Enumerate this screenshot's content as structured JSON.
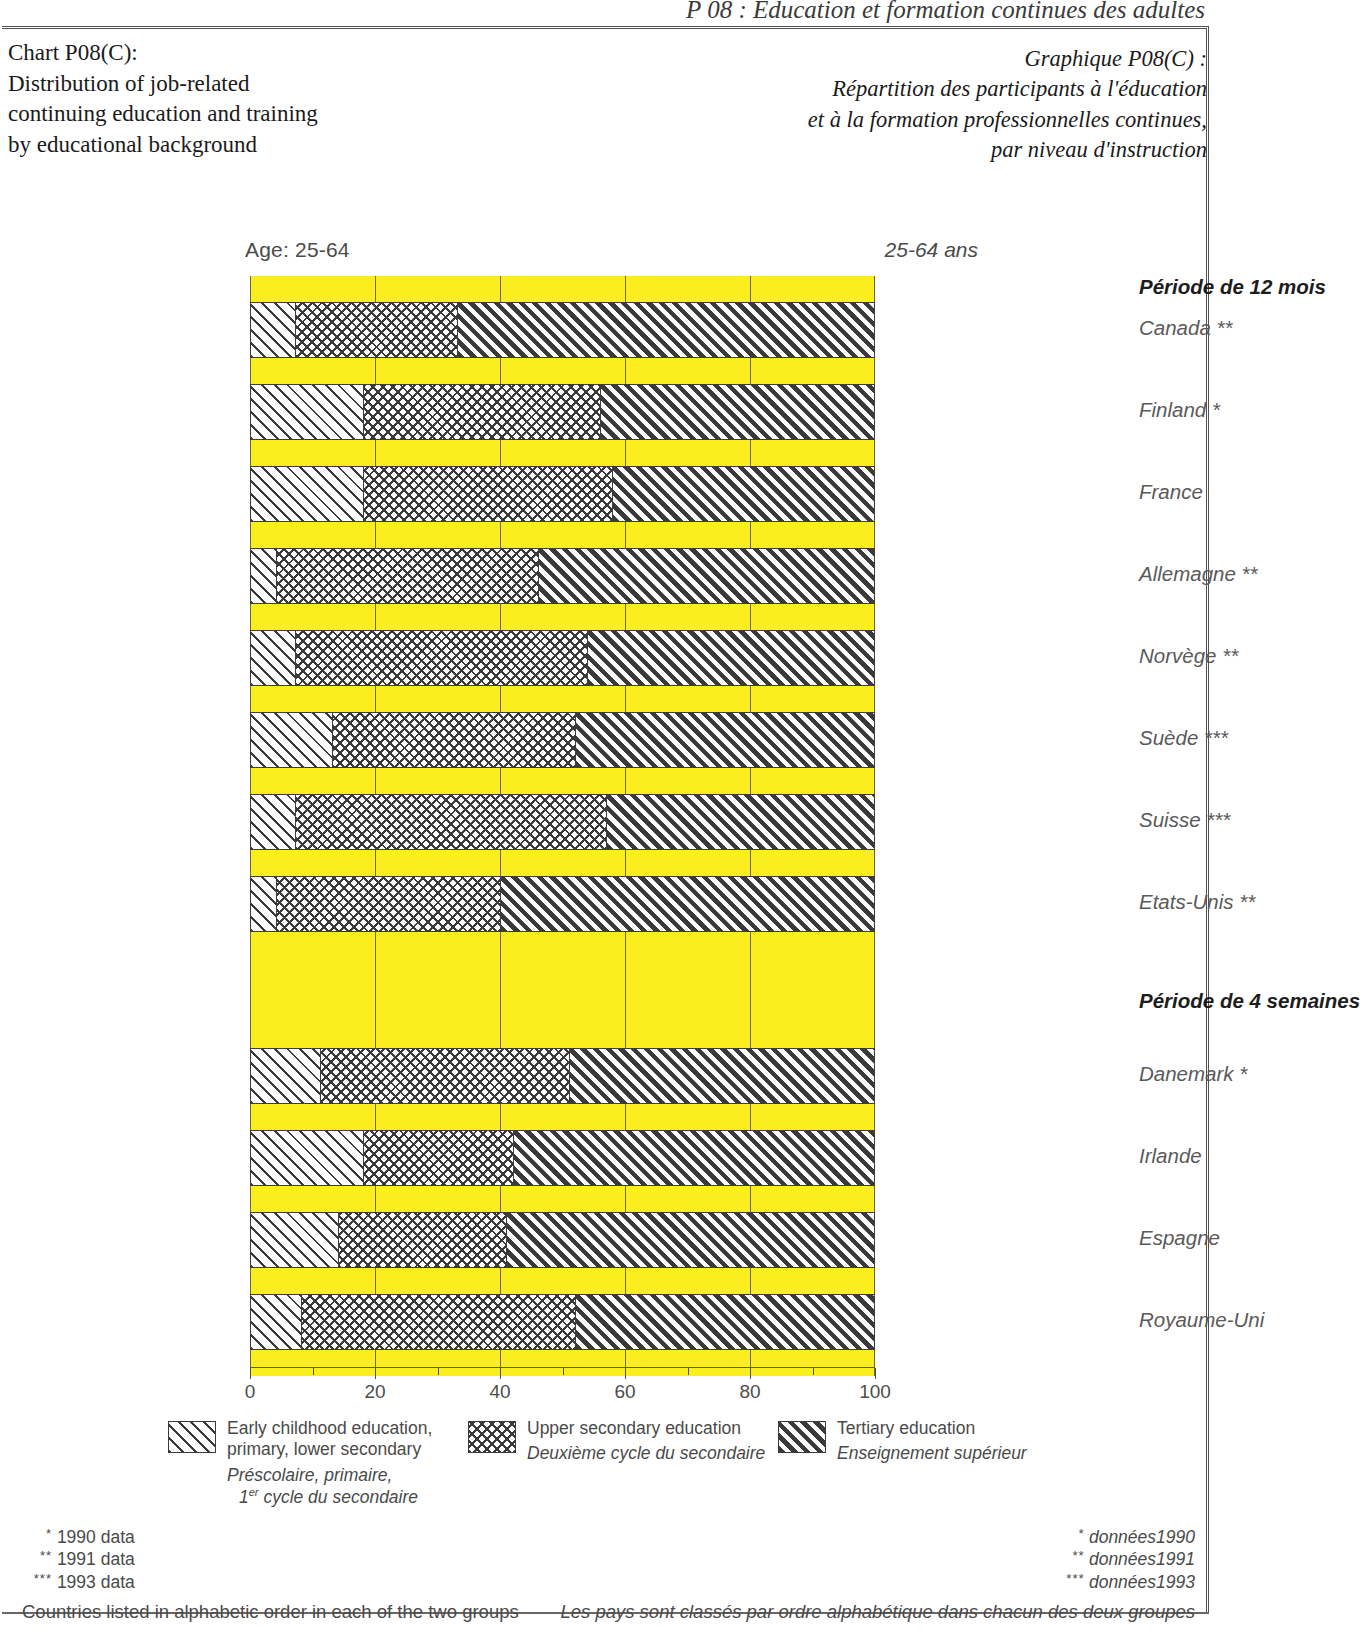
{
  "running_head": "P 08 : Éducation et formation continues des adultes",
  "title_en": "Chart P08(C):\nDistribution of job-related\ncontinuing education and training\nby educational background",
  "title_fr": "Graphique P08(C) :\nRépartition des participants à l'éducation\net à la formation professionnelles continues,\npar niveau d'instruction",
  "age_label_en": "Age: 25-64",
  "age_label_fr": "25-64 ans",
  "colors": {
    "spacer": "#faee21",
    "outline": "#403c39",
    "text": "#5a5a5a"
  },
  "legend": [
    {
      "swatch": "early-childhood-primary-lower-secondary",
      "en": "Early childhood education,\nprimary, lower secondary",
      "fr_line1": "Préscolaire, primaire,",
      "fr_line2_pre": "1",
      "fr_line2_sup": "er",
      "fr_line2_post": " cycle du secondaire"
    },
    {
      "swatch": "upper-secondary",
      "en": "Upper secondary education",
      "fr_line1": "Deuxième cycle du secondaire",
      "fr_line2_pre": "",
      "fr_line2_sup": "",
      "fr_line2_post": ""
    },
    {
      "swatch": "tertiary",
      "en": "Tertiary education",
      "fr_line1": "Enseignement supérieur",
      "fr_line2_pre": "",
      "fr_line2_sup": "",
      "fr_line2_post": ""
    }
  ],
  "footnotes_en": {
    "l1_star": "*",
    "l1": "1990 data",
    "l2_star": "**",
    "l2": "1991 data",
    "l3_star": "***",
    "l3": "1993 data",
    "note": "Countries listed in alphabetic order in each of the two groups"
  },
  "footnotes_fr": {
    "l1_star": "*",
    "l1": "données1990",
    "l2_star": "**",
    "l2": "données1991",
    "l3_star": "***",
    "l3": "données1993",
    "note": "Les pays sont classés par ordre alphabétique dans chacun des deux groupes"
  },
  "chart_data": {
    "type": "bar",
    "orientation": "horizontal",
    "stacked": true,
    "title": "Distribution of job-related continuing education and training by educational background",
    "xlabel": "",
    "ylabel": "",
    "xlim": [
      0,
      100
    ],
    "xticks": [
      0,
      20,
      40,
      60,
      80,
      100
    ],
    "xtick_labels": [
      "0",
      "20",
      "40",
      "60",
      "80",
      "100"
    ],
    "minor_xticks": [
      10,
      30,
      50,
      70,
      90
    ],
    "grid": false,
    "legend_position": "below",
    "series": [
      {
        "name": "Early childhood education, primary, lower secondary",
        "fill": "diagonal-hatch"
      },
      {
        "name": "Upper secondary education",
        "fill": "cross-hatch"
      },
      {
        "name": "Tertiary education",
        "fill": "dense-diagonal-hatch"
      }
    ],
    "groups": [
      {
        "header_en": "12-month period",
        "header_fr": "Période de 12 mois",
        "rows": [
          {
            "en": "** Canada",
            "fr": "Canada **",
            "values": [
              7,
              26,
              67
            ]
          },
          {
            "en": "* Finland",
            "fr": "Finland *",
            "values": [
              18,
              38,
              44
            ]
          },
          {
            "en": "France",
            "fr": "France",
            "values": [
              18,
              40,
              42
            ]
          },
          {
            "en": "** Germany",
            "fr": "Allemagne **",
            "values": [
              4,
              42,
              54
            ]
          },
          {
            "en": "** Norway",
            "fr": "Norvège **",
            "values": [
              7,
              47,
              46
            ]
          },
          {
            "en": "*** Sweden",
            "fr": "Suède ***",
            "values": [
              13,
              39,
              48
            ]
          },
          {
            "en": "*** Switzerland",
            "fr": "Suisse ***",
            "values": [
              7,
              50,
              43
            ]
          },
          {
            "en": "** United States",
            "fr": "Etats-Unis **",
            "values": [
              4,
              36,
              60
            ]
          }
        ]
      },
      {
        "header_en": "4-week period",
        "header_fr": "Période de 4 semaines",
        "rows": [
          {
            "en": "* Denmark",
            "fr": "Danemark *",
            "values": [
              11,
              40,
              49
            ]
          },
          {
            "en": "Ireland",
            "fr": "Irlande",
            "values": [
              18,
              24,
              58
            ]
          },
          {
            "en": "Spain",
            "fr": "Espagne",
            "values": [
              14,
              27,
              59
            ]
          },
          {
            "en": "United Kingdom",
            "fr": "Royaume-Uni",
            "values": [
              8,
              44,
              48
            ]
          }
        ]
      }
    ]
  }
}
